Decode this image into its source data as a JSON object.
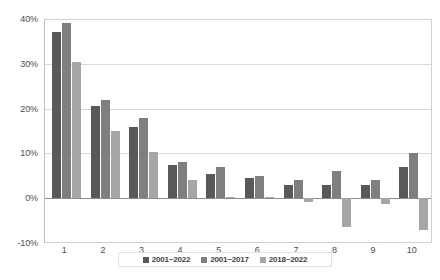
{
  "chart_data": {
    "type": "bar",
    "title": "",
    "subtitle": "",
    "xlabel": "",
    "ylabel": "",
    "categories": [
      "1",
      "2",
      "3",
      "4",
      "5",
      "6",
      "7",
      "8",
      "9",
      "10"
    ],
    "series": [
      {
        "name": "2001~2022",
        "color": "#595959",
        "values": [
          37,
          20.5,
          16,
          7.5,
          5.5,
          4.5,
          3,
          3,
          3,
          7
        ]
      },
      {
        "name": "2001~2017",
        "color": "#7f7f7f",
        "values": [
          39,
          22,
          18,
          8,
          7,
          5,
          4,
          6,
          4,
          10
        ]
      },
      {
        "name": "2018~2022",
        "color": "#a6a6a6",
        "values": [
          30.5,
          15,
          10.3,
          4,
          0.2,
          0.3,
          -0.8,
          -6.5,
          -1.2,
          -7
        ]
      }
    ],
    "ylim": [
      -10,
      40
    ],
    "ytick_labels": [
      "40%",
      "30%",
      "20%",
      "10%",
      "0%",
      "-10%"
    ],
    "ytick_values": [
      40,
      30,
      20,
      10,
      0,
      -10
    ],
    "grid": true,
    "legend_position": "bottom",
    "value_suffix": "%"
  },
  "legend": {
    "entries": [
      {
        "label": "2001~2022",
        "color": "#595959"
      },
      {
        "label": "2001~2017",
        "color": "#7f7f7f"
      },
      {
        "label": "2018~2022",
        "color": "#a6a6a6"
      }
    ]
  },
  "colors": {
    "series_dark": "#595959",
    "series_mid": "#7f7f7f",
    "series_light": "#a6a6a6",
    "gridline": "#d9d9d9",
    "zero_line": "#8c8c8c",
    "axis_text": "#4d4d4d",
    "plot_border": "#d0d0d0",
    "background": "#ffffff"
  }
}
